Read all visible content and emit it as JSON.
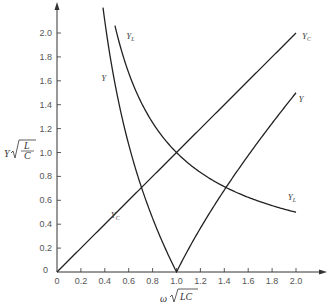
{
  "chart_data": {
    "type": "line",
    "title": "",
    "xlabel": "ω √LC",
    "ylabel": "Y √(L/C)",
    "xlim": [
      0,
      2.0
    ],
    "ylim": [
      0,
      2.0
    ],
    "grid": false,
    "x_ticks": [
      "0",
      "0.2",
      "0.4",
      "0.6",
      "0.8",
      "1.0",
      "1.2",
      "1.4",
      "1.6",
      "1.8",
      "2.0"
    ],
    "y_ticks": [
      "0",
      "0.2",
      "0.4",
      "0.6",
      "0.8",
      "1.0",
      "1.2",
      "1.4",
      "1.6",
      "1.8",
      "2.0"
    ],
    "series": [
      {
        "name": "Y_C",
        "formula": "x",
        "x": [
          0,
          2.0
        ],
        "values": [
          0,
          2.0
        ],
        "labels": [
          {
            "text": "Y_C",
            "x": 0.45,
            "y": 0.45
          },
          {
            "text": "Y_C",
            "x": 2.05,
            "y": 1.95
          }
        ]
      },
      {
        "name": "Y_L",
        "formula": "1/x",
        "x": [
          0.485,
          0.5,
          0.6,
          0.7,
          0.8,
          0.9,
          1.0,
          1.2,
          1.4,
          1.6,
          1.8,
          2.0
        ],
        "values": [
          2.06,
          2.0,
          1.67,
          1.43,
          1.25,
          1.11,
          1.0,
          0.83,
          0.71,
          0.63,
          0.56,
          0.5
        ],
        "labels": [
          {
            "text": "Y_L",
            "x": 0.58,
            "y": 1.95
          },
          {
            "text": "Y_L",
            "x": 1.93,
            "y": 0.6
          }
        ]
      },
      {
        "name": "Y",
        "formula": "|x - 1/x|",
        "x": [
          0.385,
          0.4,
          0.5,
          0.6,
          0.7,
          0.8,
          0.9,
          1.0,
          1.2,
          1.4,
          1.6,
          1.8,
          2.0
        ],
        "values": [
          2.21,
          2.1,
          1.5,
          1.07,
          0.73,
          0.45,
          0.21,
          0.0,
          0.37,
          0.69,
          0.98,
          1.24,
          1.5
        ],
        "labels": [
          {
            "text": "Y",
            "x": 0.37,
            "y": 1.6
          },
          {
            "text": "Y",
            "x": 2.02,
            "y": 1.42
          }
        ]
      }
    ]
  },
  "axes": {
    "x_title_main": "ω",
    "x_title_root": "LC",
    "y_title_main": "Y",
    "y_title_num": "L",
    "y_title_den": "C"
  }
}
